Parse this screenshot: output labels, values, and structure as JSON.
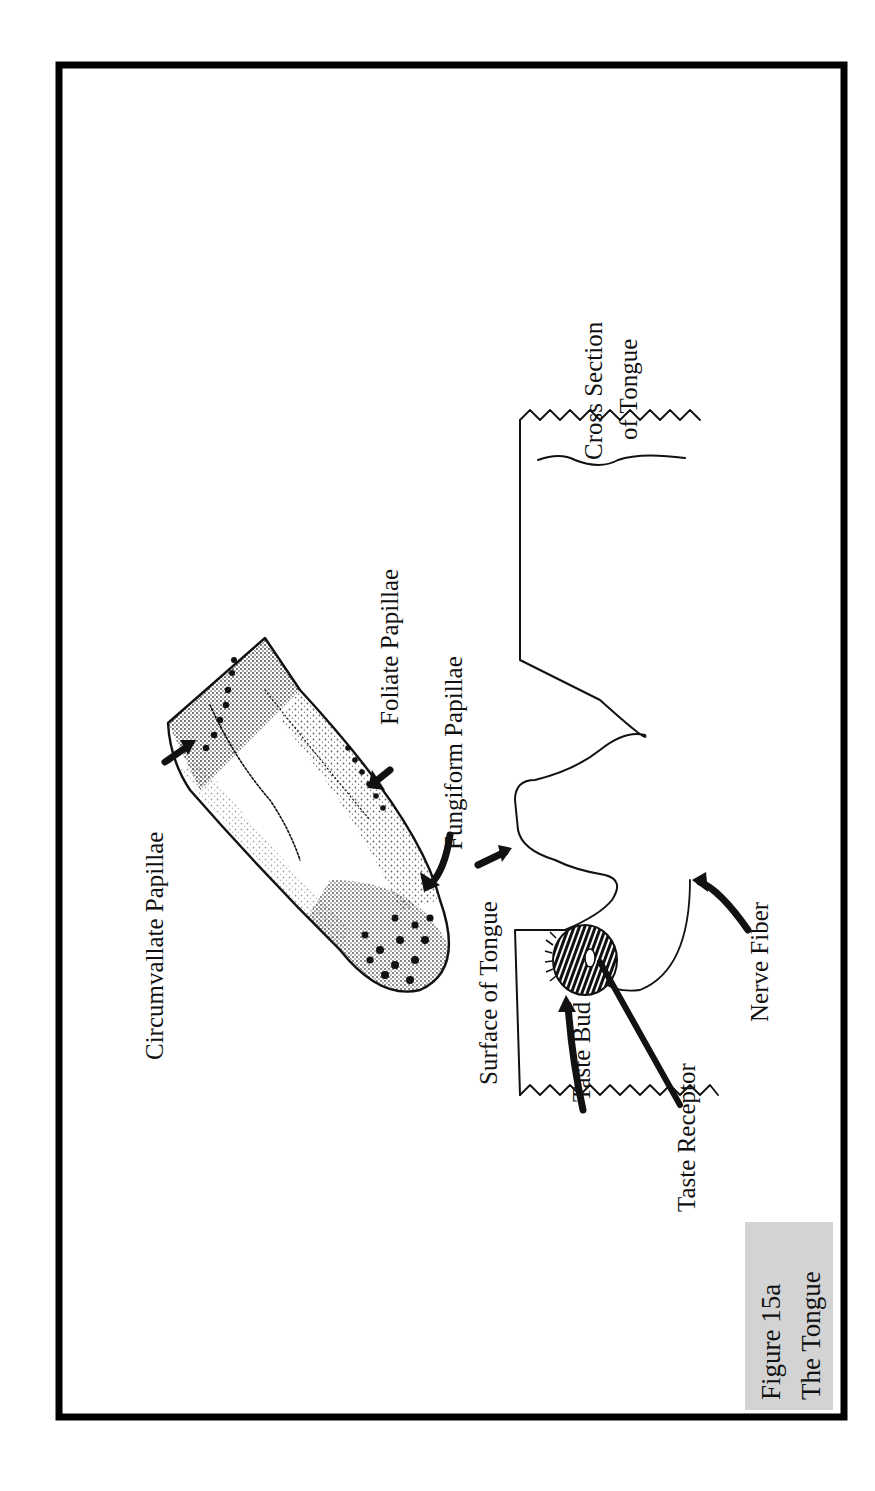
{
  "figure": {
    "caption_line1": "Figure 15a",
    "caption_line2": "The Tongue",
    "caption_bg": "#d3d3d3",
    "frame_color": "#000000",
    "orientation": "rotated 90° counter-clockwise (text reads bottom-to-top)"
  },
  "labels": {
    "circumvallate": "Circumvallate Papillae",
    "foliate": "Foliate Papillae",
    "fungiform_top": "Fungiform Papillae",
    "surface": "Surface of Tongue",
    "taste_bud": "Taste Bud",
    "taste_receptor": "Taste Receptor",
    "nerve_fiber": "Nerve Fiber",
    "cross_section_line1": "Cross Section",
    "cross_section_line2": "of Tongue"
  },
  "parts": [
    {
      "name": "tongue-outline",
      "type": "stippled-illustration"
    },
    {
      "name": "cross-section",
      "type": "line-drawing",
      "components": [
        "surface",
        "fungiform papilla",
        "taste bud",
        "taste receptor",
        "nerve fiber"
      ]
    }
  ]
}
